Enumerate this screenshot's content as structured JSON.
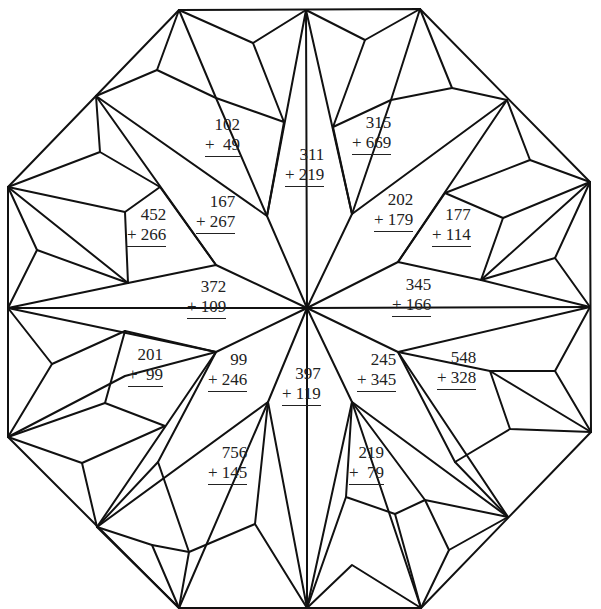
{
  "worksheet": {
    "type": "addition color-by-sum quilt",
    "problems": [
      {
        "id": "p1",
        "a": "102",
        "b": "+  49",
        "x": 205,
        "y": 115
      },
      {
        "id": "p2",
        "a": "311",
        "b": "+ 219",
        "x": 285,
        "y": 145
      },
      {
        "id": "p3",
        "a": "315",
        "b": "+ 669",
        "x": 352,
        "y": 113
      },
      {
        "id": "p4",
        "a": "167",
        "b": "+ 267",
        "x": 196,
        "y": 192
      },
      {
        "id": "p5",
        "a": "452",
        "b": "+ 266",
        "x": 127,
        "y": 205
      },
      {
        "id": "p6",
        "a": "202",
        "b": "+ 179",
        "x": 374,
        "y": 190
      },
      {
        "id": "p7",
        "a": "177",
        "b": "+ 114",
        "x": 432,
        "y": 205
      },
      {
        "id": "p8",
        "a": "372",
        "b": "+ 109",
        "x": 187,
        "y": 277
      },
      {
        "id": "p9",
        "a": "345",
        "b": "+ 166",
        "x": 392,
        "y": 275
      },
      {
        "id": "p10",
        "a": "201",
        "b": "+  99",
        "x": 128,
        "y": 345
      },
      {
        "id": "p11",
        "a": "99",
        "b": "+ 246",
        "x": 208,
        "y": 350
      },
      {
        "id": "p12",
        "a": "397",
        "b": "+ 119",
        "x": 282,
        "y": 364
      },
      {
        "id": "p13",
        "a": "245",
        "b": "+ 345",
        "x": 357,
        "y": 350
      },
      {
        "id": "p14",
        "a": "548",
        "b": "+ 328",
        "x": 437,
        "y": 348
      },
      {
        "id": "p15",
        "a": "756",
        "b": "+ 145",
        "x": 208,
        "y": 443
      },
      {
        "id": "p16",
        "a": "219",
        "b": "+  79",
        "x": 349,
        "y": 443
      }
    ]
  }
}
